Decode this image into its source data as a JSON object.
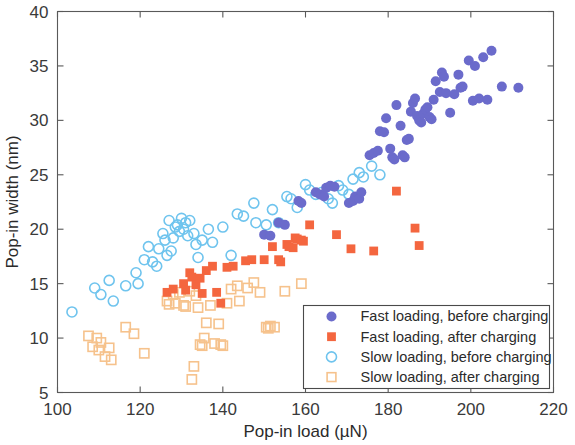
{
  "chart_data": {
    "type": "scatter",
    "title": "",
    "xlabel": "Pop-in load (µN)",
    "ylabel": "Pop-in width (nm)",
    "xlim": [
      100,
      220
    ],
    "ylim": [
      5,
      40
    ],
    "xticks": [
      100,
      120,
      140,
      160,
      180,
      200,
      220
    ],
    "yticks": [
      5,
      10,
      15,
      20,
      25,
      30,
      35,
      40
    ],
    "xtick_labels": [
      "100",
      "120",
      "140",
      "160",
      "180",
      "200",
      "220"
    ],
    "ytick_labels": [
      "5",
      "10",
      "15",
      "20",
      "25",
      "30",
      "35",
      "40"
    ],
    "grid": false,
    "legend_position": "lower right",
    "series": [
      {
        "name": "Fast loading, before charging",
        "marker": "filled-circle",
        "color": "#6B6BCB",
        "edge_color": "#6B6BCB",
        "points": [
          [
            150.0,
            19.5
          ],
          [
            151.5,
            19.4
          ],
          [
            153.5,
            20.6
          ],
          [
            155.0,
            20.4
          ],
          [
            158.3,
            22.6
          ],
          [
            159.0,
            22.4
          ],
          [
            162.5,
            23.4
          ],
          [
            163.5,
            23.2
          ],
          [
            164.5,
            23.0
          ],
          [
            165.0,
            23.8
          ],
          [
            166.0,
            24.0
          ],
          [
            167.0,
            23.9
          ],
          [
            170.5,
            22.4
          ],
          [
            171.5,
            22.6
          ],
          [
            172.0,
            23.0
          ],
          [
            173.0,
            22.8
          ],
          [
            173.5,
            23.4
          ],
          [
            175.5,
            26.8
          ],
          [
            176.5,
            27.0
          ],
          [
            177.5,
            27.2
          ],
          [
            178.0,
            29.0
          ],
          [
            179.0,
            28.9
          ],
          [
            179.5,
            30.2
          ],
          [
            180.5,
            27.4
          ],
          [
            181.0,
            26.6
          ],
          [
            181.5,
            26.4
          ],
          [
            182.0,
            31.4
          ],
          [
            183.0,
            29.5
          ],
          [
            183.5,
            26.8
          ],
          [
            184.0,
            26.6
          ],
          [
            184.5,
            28.2
          ],
          [
            185.0,
            28.3
          ],
          [
            185.5,
            30.8
          ],
          [
            186.0,
            31.6
          ],
          [
            186.5,
            32.0
          ],
          [
            187.0,
            30.4
          ],
          [
            187.5,
            30.0
          ],
          [
            188.0,
            29.8
          ],
          [
            188.5,
            30.6
          ],
          [
            189.0,
            31.0
          ],
          [
            189.5,
            31.2
          ],
          [
            190.0,
            30.3
          ],
          [
            190.5,
            30.1
          ],
          [
            191.0,
            31.9
          ],
          [
            191.5,
            33.6
          ],
          [
            192.5,
            32.6
          ],
          [
            193.0,
            34.4
          ],
          [
            193.5,
            34.0
          ],
          [
            194.0,
            32.5
          ],
          [
            195.0,
            30.7
          ],
          [
            196.0,
            32.4
          ],
          [
            197.0,
            34.2
          ],
          [
            197.5,
            33.0
          ],
          [
            198.0,
            33.1
          ],
          [
            199.5,
            35.5
          ],
          [
            200.5,
            31.8
          ],
          [
            201.0,
            35.0
          ],
          [
            202.0,
            32.0
          ],
          [
            203.0,
            35.8
          ],
          [
            204.0,
            31.9
          ],
          [
            205.0,
            36.4
          ],
          [
            207.5,
            33.1
          ],
          [
            211.5,
            33.0
          ]
        ]
      },
      {
        "name": "Fast loading, after charging",
        "marker": "filled-square",
        "color": "#F4663F",
        "edge_color": "#F4663F",
        "points": [
          [
            126.5,
            14.2
          ],
          [
            128.0,
            14.5
          ],
          [
            130.5,
            15.0
          ],
          [
            131.0,
            14.4
          ],
          [
            132.0,
            16.0
          ],
          [
            132.5,
            15.6
          ],
          [
            133.5,
            14.9
          ],
          [
            134.5,
            15.5
          ],
          [
            135.0,
            14.1
          ],
          [
            136.0,
            16.2
          ],
          [
            137.5,
            16.6
          ],
          [
            138.5,
            14.2
          ],
          [
            139.5,
            13.2
          ],
          [
            141.0,
            16.5
          ],
          [
            142.5,
            16.6
          ],
          [
            145.5,
            17.1
          ],
          [
            147.0,
            17.2
          ],
          [
            150.0,
            17.2
          ],
          [
            152.0,
            18.4
          ],
          [
            153.5,
            17.2
          ],
          [
            154.0,
            17.0
          ],
          [
            155.5,
            18.6
          ],
          [
            156.0,
            18.4
          ],
          [
            157.0,
            18.3
          ],
          [
            157.5,
            19.2
          ],
          [
            158.0,
            19.1
          ],
          [
            159.0,
            19.0
          ],
          [
            159.5,
            18.9
          ],
          [
            161.0,
            20.4
          ],
          [
            167.5,
            19.5
          ],
          [
            171.0,
            18.2
          ],
          [
            176.5,
            18.0
          ],
          [
            182.0,
            23.5
          ],
          [
            186.5,
            20.1
          ],
          [
            187.5,
            18.5
          ]
        ]
      },
      {
        "name": "Slow loading, before charging",
        "marker": "open-circle",
        "color": "#ffffff",
        "edge_color": "#6FC4EE",
        "points": [
          [
            103.5,
            12.4
          ],
          [
            109.0,
            14.6
          ],
          [
            110.5,
            14.0
          ],
          [
            112.5,
            15.3
          ],
          [
            113.5,
            13.4
          ],
          [
            116.5,
            14.8
          ],
          [
            119.0,
            16.0
          ],
          [
            119.5,
            15.0
          ],
          [
            121.0,
            17.2
          ],
          [
            122.0,
            18.4
          ],
          [
            123.0,
            17.0
          ],
          [
            124.0,
            16.6
          ],
          [
            124.5,
            18.2
          ],
          [
            125.5,
            19.6
          ],
          [
            126.0,
            19.0
          ],
          [
            126.5,
            17.6
          ],
          [
            127.0,
            20.8
          ],
          [
            127.5,
            18.0
          ],
          [
            128.0,
            19.2
          ],
          [
            128.5,
            20.2
          ],
          [
            129.0,
            20.4
          ],
          [
            129.5,
            19.8
          ],
          [
            130.0,
            21.0
          ],
          [
            130.5,
            20.0
          ],
          [
            131.0,
            20.6
          ],
          [
            131.5,
            19.4
          ],
          [
            132.0,
            20.8
          ],
          [
            133.0,
            19.6
          ],
          [
            133.5,
            18.6
          ],
          [
            134.0,
            17.4
          ],
          [
            135.0,
            19.0
          ],
          [
            136.5,
            20.0
          ],
          [
            137.5,
            18.8
          ],
          [
            140.0,
            20.2
          ],
          [
            142.0,
            17.6
          ],
          [
            143.5,
            21.4
          ],
          [
            145.0,
            21.2
          ],
          [
            147.5,
            22.4
          ],
          [
            148.0,
            20.6
          ],
          [
            150.5,
            20.4
          ],
          [
            152.0,
            21.8
          ],
          [
            153.5,
            20.6
          ],
          [
            155.5,
            23.0
          ],
          [
            156.5,
            22.8
          ],
          [
            158.0,
            22.0
          ],
          [
            160.0,
            24.1
          ],
          [
            161.0,
            23.6
          ],
          [
            162.5,
            23.2
          ],
          [
            164.0,
            23.4
          ],
          [
            165.5,
            22.8
          ],
          [
            166.5,
            22.4
          ],
          [
            168.0,
            24.0
          ],
          [
            169.0,
            23.6
          ],
          [
            170.5,
            23.2
          ],
          [
            171.5,
            24.6
          ],
          [
            173.0,
            25.2
          ],
          [
            174.0,
            24.8
          ],
          [
            176.0,
            25.8
          ],
          [
            178.0,
            25.0
          ]
        ]
      },
      {
        "name": "Slow loading, after charging",
        "marker": "open-square",
        "color": "#ffffff",
        "edge_color": "#F6C28C",
        "points": [
          [
            107.5,
            10.2
          ],
          [
            108.5,
            9.2
          ],
          [
            109.5,
            10.0
          ],
          [
            110.0,
            8.9
          ],
          [
            110.5,
            9.6
          ],
          [
            111.5,
            8.3
          ],
          [
            112.5,
            9.1
          ],
          [
            113.0,
            8.0
          ],
          [
            116.5,
            11.0
          ],
          [
            118.5,
            10.4
          ],
          [
            121.0,
            8.6
          ],
          [
            126.5,
            13.4
          ],
          [
            127.0,
            13.1
          ],
          [
            128.0,
            14.0
          ],
          [
            128.5,
            13.2
          ],
          [
            129.5,
            14.2
          ],
          [
            130.5,
            13.0
          ],
          [
            131.0,
            12.9
          ],
          [
            132.0,
            14.3
          ],
          [
            132.5,
            6.2
          ],
          [
            133.0,
            7.4
          ],
          [
            133.5,
            13.9
          ],
          [
            134.0,
            12.8
          ],
          [
            134.5,
            9.4
          ],
          [
            135.0,
            9.3
          ],
          [
            135.5,
            10.0
          ],
          [
            136.0,
            11.4
          ],
          [
            137.0,
            13.0
          ],
          [
            138.0,
            9.5
          ],
          [
            139.0,
            11.3
          ],
          [
            139.5,
            9.4
          ],
          [
            140.0,
            9.3
          ],
          [
            141.0,
            13.2
          ],
          [
            142.0,
            14.5
          ],
          [
            143.5,
            14.8
          ],
          [
            144.0,
            13.4
          ],
          [
            146.0,
            14.6
          ],
          [
            147.5,
            15.1
          ],
          [
            149.0,
            14.2
          ],
          [
            150.5,
            11.0
          ],
          [
            151.0,
            10.9
          ],
          [
            151.5,
            11.1
          ],
          [
            152.5,
            11.0
          ],
          [
            155.0,
            14.3
          ],
          [
            159.0,
            15.0
          ]
        ]
      }
    ]
  },
  "axes": {
    "x_title": "Pop-in load (µN)",
    "y_title": "Pop-in width (nm)"
  },
  "legend": {
    "items": [
      {
        "label": "Fast loading, before charging",
        "marker": "filled-circle",
        "color": "#6B6BCB"
      },
      {
        "label": "Fast loading, after charging",
        "marker": "filled-square",
        "color": "#F4663F"
      },
      {
        "label": "Slow loading, before charging",
        "marker": "open-circle",
        "color": "#6FC4EE"
      },
      {
        "label": "Slow loading, after charging",
        "marker": "open-square",
        "color": "#F6C28C"
      }
    ]
  }
}
